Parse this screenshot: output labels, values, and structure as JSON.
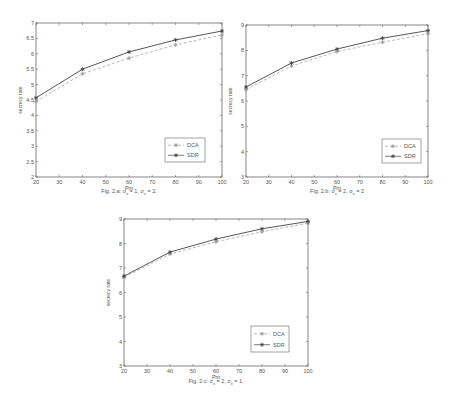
{
  "chart_data": [
    {
      "id": "a",
      "type": "line",
      "title": "",
      "caption": "Fig. 2.a: σs = 1, σx = 2.",
      "caption_parts": {
        "prefix": "Fig. 2.a: ",
        "p1": "σ",
        "s1": "s",
        "v1": " = 1, ",
        "p2": "σ",
        "s2": "x",
        "v2": " = 2."
      },
      "xlabel": "Pm",
      "ylabel": "secrecy rate",
      "x": [
        20,
        40,
        60,
        80,
        100
      ],
      "xlim": [
        20,
        100
      ],
      "ylim": [
        2,
        7
      ],
      "xticks": [
        20,
        30,
        40,
        50,
        60,
        70,
        80,
        90,
        100
      ],
      "yticks": [
        2,
        2.5,
        3,
        3.5,
        4,
        4.5,
        5,
        5.5,
        6,
        6.5,
        7
      ],
      "ytick_labels": [
        "2",
        "2.5",
        "3",
        "3.5",
        "4",
        "4.5",
        "5",
        "5.5",
        "6",
        "6.5",
        "7"
      ],
      "grid": false,
      "legend_position": "lower right",
      "series": [
        {
          "name": "DCA",
          "style": "dashed",
          "marker": "*",
          "values": [
            4.45,
            5.35,
            5.86,
            6.29,
            6.61
          ]
        },
        {
          "name": "SDR",
          "style": "solid",
          "marker": "*",
          "values": [
            4.57,
            5.5,
            6.06,
            6.45,
            6.74
          ]
        }
      ]
    },
    {
      "id": "b",
      "type": "line",
      "title": "",
      "caption": "Fig. 2.b: σs = 2, σx = 2",
      "caption_parts": {
        "prefix": "Fig. 2.b: ",
        "p1": "σ",
        "s1": "s",
        "v1": " = 2, ",
        "p2": "σ",
        "s2": "x",
        "v2": " = 2"
      },
      "xlabel": "Pm",
      "ylabel": "secrecy rate",
      "x": [
        20,
        40,
        60,
        80,
        100
      ],
      "xlim": [
        20,
        100
      ],
      "ylim": [
        3,
        9
      ],
      "xticks": [
        20,
        30,
        40,
        50,
        60,
        70,
        80,
        90,
        100
      ],
      "yticks": [
        3,
        4,
        5,
        6,
        7,
        8,
        9
      ],
      "ytick_labels": [
        "3",
        "4",
        "5",
        "6",
        "7",
        "8",
        "9"
      ],
      "grid": false,
      "legend_position": "lower right",
      "series": [
        {
          "name": "DCA",
          "style": "dashed",
          "marker": "*",
          "values": [
            6.45,
            7.38,
            7.95,
            8.32,
            8.66
          ]
        },
        {
          "name": "SDR",
          "style": "solid",
          "marker": "*",
          "values": [
            6.55,
            7.5,
            8.05,
            8.48,
            8.78
          ]
        }
      ]
    },
    {
      "id": "c",
      "type": "line",
      "title": "",
      "caption": "Fig. 2.c: σs = 2, σx = 1.",
      "caption_parts": {
        "prefix": "Fig. 2.c: ",
        "p1": "σ",
        "s1": "s",
        "v1": " = 2, ",
        "p2": "σ",
        "s2": "x",
        "v2": " = 1."
      },
      "xlabel": "Pm",
      "ylabel": "secrecy rate",
      "x": [
        20,
        40,
        60,
        80,
        100
      ],
      "xlim": [
        20,
        100
      ],
      "ylim": [
        3,
        9
      ],
      "xticks": [
        20,
        30,
        40,
        50,
        60,
        70,
        80,
        90,
        100
      ],
      "yticks": [
        3,
        4,
        5,
        6,
        7,
        8,
        9
      ],
      "ytick_labels": [
        "3",
        "4",
        "5",
        "6",
        "7",
        "8",
        "9"
      ],
      "grid": false,
      "legend_position": "lower right",
      "series": [
        {
          "name": "DCA",
          "style": "dashed",
          "marker": "*",
          "values": [
            6.62,
            7.57,
            8.07,
            8.48,
            8.83
          ]
        },
        {
          "name": "SDR",
          "style": "solid",
          "marker": "*",
          "values": [
            6.67,
            7.65,
            8.18,
            8.6,
            8.9
          ]
        }
      ]
    }
  ],
  "layout": {
    "a": {
      "left": 36,
      "top": 23,
      "right": 222,
      "bottom": 177,
      "legend": {
        "x": 165,
        "y": 138,
        "w": 40,
        "h": 24
      },
      "caption_x": 129,
      "caption_y": 193
    },
    "b": {
      "left": 246,
      "top": 25,
      "right": 428,
      "bottom": 177,
      "legend": {
        "x": 382,
        "y": 139,
        "w": 39,
        "h": 24
      },
      "caption_x": 337,
      "caption_y": 193
    },
    "c": {
      "left": 124,
      "top": 219,
      "right": 308,
      "bottom": 366,
      "legend": {
        "x": 251,
        "y": 326,
        "w": 38,
        "h": 26
      },
      "caption_x": 216,
      "caption_y": 383
    }
  },
  "colors": {
    "axis": "#666666",
    "sdr": "#444444",
    "dca": "#999999",
    "text": "#555555"
  }
}
